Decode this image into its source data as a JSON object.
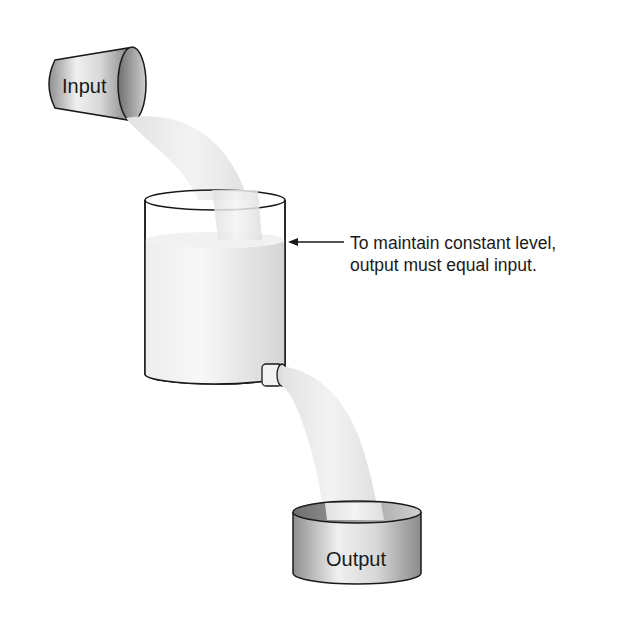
{
  "diagram": {
    "type": "flow-balance illustration",
    "elements": {
      "input_bucket": {
        "label": "Input"
      },
      "tank": {
        "description": "cylindrical tank with liquid at constant level, side outlet spout"
      },
      "output_bucket": {
        "label": "Output"
      }
    },
    "annotation": {
      "line1": "To maintain constant level,",
      "line2": "output must equal input."
    },
    "colors": {
      "outline": "#1a1a1a",
      "liquid": "#e6e6e6",
      "stream": "#ececec",
      "metal_dark": "#8c8c8c",
      "metal_light": "#f2f2f2"
    }
  }
}
